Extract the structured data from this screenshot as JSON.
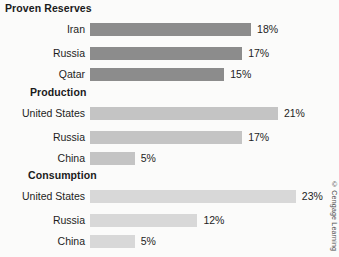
{
  "credit": "© Cengage Learning",
  "chart_data": {
    "type": "bar",
    "orientation": "horizontal",
    "title": "",
    "xlabel": "",
    "ylabel": "",
    "xlim": [
      0,
      25
    ],
    "grid": false,
    "legend": "none",
    "value_suffix": "%",
    "groups": [
      {
        "name": "Proven Reserves",
        "color": "#8c8c8c",
        "categories": [
          "Iran",
          "Russia",
          "Qatar"
        ],
        "values": [
          18,
          17,
          15
        ],
        "value_labels": [
          "18%",
          "17%",
          "15%"
        ]
      },
      {
        "name": "Production",
        "color": "#c4c4c4",
        "categories": [
          "United States",
          "Russia",
          "China"
        ],
        "values": [
          21,
          17,
          5
        ],
        "value_labels": [
          "21%",
          "17%",
          "5%"
        ]
      },
      {
        "name": "Consumption",
        "color": "#d8d8d8",
        "categories": [
          "United States",
          "Russia",
          "China"
        ],
        "values": [
          23,
          12,
          5
        ],
        "value_labels": [
          "23%",
          "12%",
          "5%"
        ]
      }
    ]
  }
}
